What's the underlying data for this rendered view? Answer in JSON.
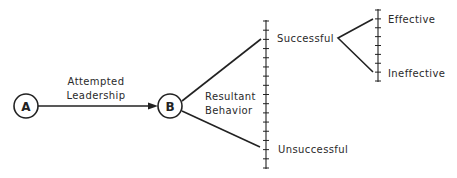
{
  "diagram": {
    "type": "flow-tree",
    "nodes": [
      {
        "id": "A",
        "label": "A"
      },
      {
        "id": "B",
        "label": "B"
      }
    ],
    "edge_label": {
      "line1": "Attempted",
      "line2": "Leadership"
    },
    "branch_label": {
      "line1": "Resultant",
      "line2": "Behavior"
    },
    "outcomes": {
      "successful": "Successful",
      "unsuccessful": "Unsuccessful"
    },
    "sub_outcomes": {
      "effective": "Effective",
      "ineffective": "Ineffective"
    },
    "colors": {
      "ink": "#222222",
      "background": "#ffffff"
    }
  }
}
